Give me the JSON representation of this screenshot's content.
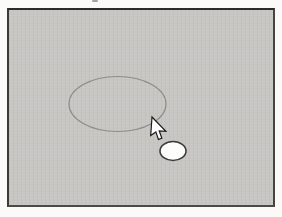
{
  "page": {
    "background_color": "#fbfaf8"
  },
  "canvas": {
    "background_color": "#c7c6c3",
    "border_color": "#2f2f2d"
  },
  "shapes": {
    "large_oval": {
      "type": "ellipse",
      "cx": 117.5,
      "cy": 104,
      "rx": 48.5,
      "ry": 27.5,
      "fill": "none",
      "stroke": "#8d8d89"
    },
    "small_oval": {
      "type": "ellipse",
      "cx": 173,
      "cy": 151,
      "rx": 13,
      "ry": 9.5,
      "fill": "#fdfdfb",
      "stroke": "#3c3c3a"
    }
  },
  "cursor": {
    "icon": "arrow-cursor-icon",
    "transform": "translate(152,117) rotate(4)",
    "fill": "#ffffff",
    "stroke": "#1b1b1b"
  }
}
